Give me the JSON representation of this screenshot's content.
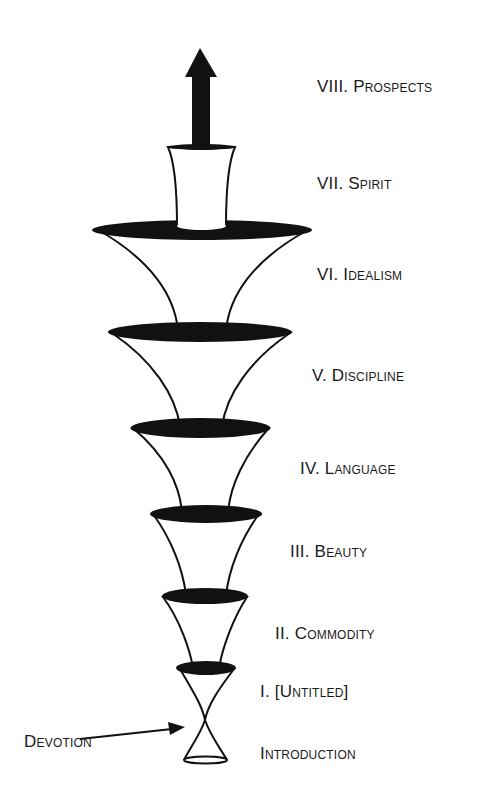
{
  "diagram": {
    "stages": [
      {
        "id": "prospects",
        "label": "VIII. Prospects"
      },
      {
        "id": "spirit",
        "label": "VII. Spirit"
      },
      {
        "id": "idealism",
        "label": "VI. Idealism"
      },
      {
        "id": "discipline",
        "label": "V. Discipline"
      },
      {
        "id": "language",
        "label": "IV. Language"
      },
      {
        "id": "beauty",
        "label": "III. Beauty"
      },
      {
        "id": "commodity",
        "label": "II. Commodity"
      },
      {
        "id": "untitled",
        "label": "I. [Untitled]"
      },
      {
        "id": "introduction",
        "label": "Introduction"
      }
    ],
    "annotation": {
      "label": "Devotion",
      "points_to": "hourglass-neck"
    },
    "colors": {
      "ink": "#111111",
      "fill": "#ffffff",
      "text": "#1a1a1a"
    },
    "icons": {
      "top": "up-arrow-icon",
      "annotation": "pointer-arrow-icon"
    }
  }
}
